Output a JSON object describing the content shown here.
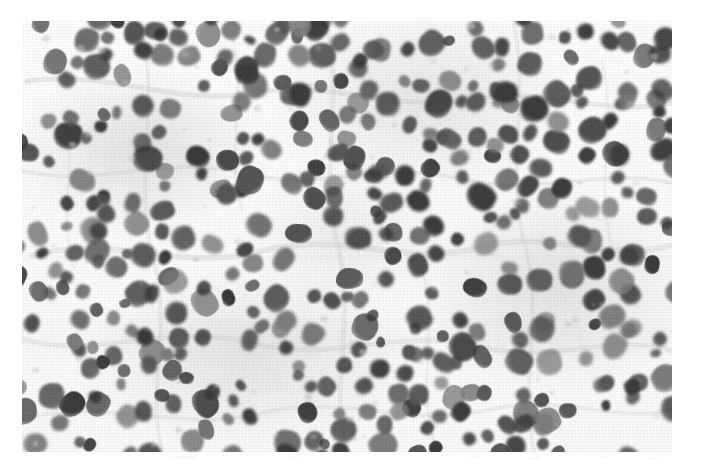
{
  "page": {
    "width": 701,
    "height": 465,
    "background_color": "#ffffff",
    "margin_color": "#ffffff"
  },
  "figure": {
    "kind": "photomicrograph",
    "color_mode": "grayscale",
    "plate": {
      "left": 22,
      "top": 21,
      "width": 650,
      "height": 431
    },
    "palette": {
      "background": "#fbfbfb",
      "interstitium": "#ededed",
      "nucleus_dark": "#3a3a3a",
      "nucleus_mid": "#555555",
      "nucleus_light": "#7d7d7d",
      "stroma": "#c8c8c8"
    },
    "texture": {
      "grain": "print-halftone",
      "nucleus_count_approx": 420,
      "nucleus_diameter_px_min": 11,
      "nucleus_diameter_px_max": 27
    }
  },
  "caption": {
    "visible_text": "",
    "note": "caption area cropped; only faint ink traces remain in the lower margin"
  }
}
